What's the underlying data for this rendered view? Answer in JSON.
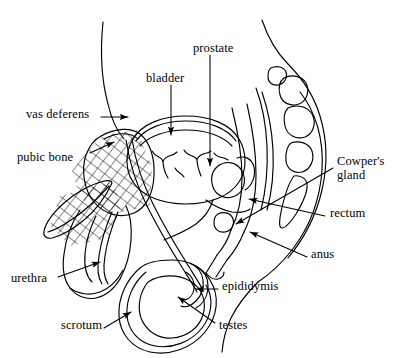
{
  "figure": {
    "background_color": "#ffffff",
    "ink_color": "#000000",
    "width": 404,
    "height": 358
  },
  "labels": [
    {
      "id": "prostate",
      "text": "prostate",
      "x": 193,
      "y": 48,
      "anchor": "start",
      "two_line": false
    },
    {
      "id": "bladder",
      "text": "bladder",
      "x": 146,
      "y": 78,
      "anchor": "start",
      "two_line": false
    },
    {
      "id": "vas-deferens",
      "text": "vas deferens",
      "x": 26,
      "y": 114,
      "anchor": "start",
      "two_line": false
    },
    {
      "id": "pubic-bone",
      "text": "pubic bone",
      "x": 17,
      "y": 157,
      "anchor": "start",
      "two_line": false
    },
    {
      "id": "cowpers-gland",
      "text": "Cowper's\ngland",
      "x": 337,
      "y": 160,
      "anchor": "start",
      "two_line": true
    },
    {
      "id": "rectum",
      "text": "rectum",
      "x": 330,
      "y": 213,
      "anchor": "start",
      "two_line": false
    },
    {
      "id": "anus",
      "text": "anus",
      "x": 311,
      "y": 254,
      "anchor": "start",
      "two_line": false
    },
    {
      "id": "urethra",
      "text": "urethra",
      "x": 11,
      "y": 278,
      "anchor": "start",
      "two_line": false
    },
    {
      "id": "epididymis",
      "text": "epididymis",
      "x": 222,
      "y": 286,
      "anchor": "start",
      "two_line": false
    },
    {
      "id": "scrotum",
      "text": "scrotum",
      "x": 61,
      "y": 325,
      "anchor": "start",
      "two_line": false
    },
    {
      "id": "testes",
      "text": "testes",
      "x": 219,
      "y": 325,
      "anchor": "start",
      "two_line": false
    }
  ],
  "structures": [
    {
      "id": "body-outline",
      "name": "body-outline"
    },
    {
      "id": "bladder-organ",
      "name": "bladder"
    },
    {
      "id": "prostate-organ",
      "name": "prostate"
    },
    {
      "id": "pubic-bone-organ",
      "name": "pubic-bone"
    },
    {
      "id": "vertebrae",
      "name": "vertebral-column"
    },
    {
      "id": "sacrum-coccyx",
      "name": "sacrum-coccyx"
    },
    {
      "id": "rectum-organ",
      "name": "rectum"
    },
    {
      "id": "anus-organ",
      "name": "anus"
    },
    {
      "id": "vas-deferens-tube",
      "name": "vas-deferens"
    },
    {
      "id": "penis-shaft",
      "name": "penis"
    },
    {
      "id": "urethra-tube",
      "name": "urethra"
    },
    {
      "id": "scrotum-sac",
      "name": "scrotum"
    },
    {
      "id": "testis-organ",
      "name": "testis"
    },
    {
      "id": "epididymis-organ",
      "name": "epididymis"
    },
    {
      "id": "cowpers-organ",
      "name": "cowpers-gland"
    }
  ]
}
